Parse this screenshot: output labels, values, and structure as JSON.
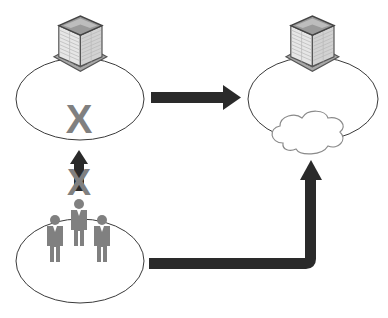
{
  "diagram": {
    "nodes": [
      {
        "id": "on_prem",
        "label": "On-premises site (building)",
        "shape": "ellipse",
        "icon": "building-icon",
        "marker": "X"
      },
      {
        "id": "cloud_site",
        "label": "Cloud-hosted site (building + cloud)",
        "shape": "ellipse",
        "icons": [
          "building-icon",
          "cloud-icon"
        ]
      },
      {
        "id": "users",
        "label": "Users group",
        "shape": "ellipse",
        "icon": "people-icon",
        "count": 3
      }
    ],
    "edges": [
      {
        "from": "on_prem",
        "to": "cloud_site",
        "style": "solid-arrow",
        "label": ""
      },
      {
        "from": "users",
        "to": "on_prem",
        "style": "blocked-arrow",
        "marker": "X"
      },
      {
        "from": "users",
        "to": "cloud_site",
        "style": "elbow-arrow",
        "label": ""
      }
    ],
    "markers": {
      "blocked_text": "X"
    },
    "colors": {
      "arrow": "#2a2a2a",
      "x_marker": "#808080",
      "person": "#808080",
      "ellipse_stroke": "#3a3a3a",
      "building_face_light": "#e6e6e6",
      "building_face_mid": "#c9c9c9",
      "building_outline": "#555555",
      "building_roof": "#9a9a9a",
      "building_base": "#a8a8a8",
      "cloud_stroke": "#8a8a8a"
    }
  }
}
